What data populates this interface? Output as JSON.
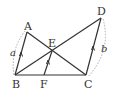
{
  "diagram": {
    "points": {
      "A": {
        "label": "A",
        "x": 27,
        "y": 32
      },
      "B": {
        "label": "B",
        "x": 15,
        "y": 75
      },
      "C": {
        "label": "C",
        "x": 86,
        "y": 75
      },
      "D": {
        "label": "D",
        "x": 101,
        "y": 18
      },
      "E": {
        "label": "E",
        "x": 52,
        "y": 51
      },
      "F": {
        "label": "F",
        "x": 44,
        "y": 75
      }
    },
    "segments": [
      "AB",
      "AC",
      "BD",
      "CD",
      "BC",
      "EF"
    ],
    "parallel_marks": [
      "AB",
      "EF",
      "CD"
    ],
    "lengths": {
      "AB": "a",
      "CD": "b"
    },
    "colors": {
      "line": "#333333",
      "dashed": "#aaaaaa"
    }
  }
}
